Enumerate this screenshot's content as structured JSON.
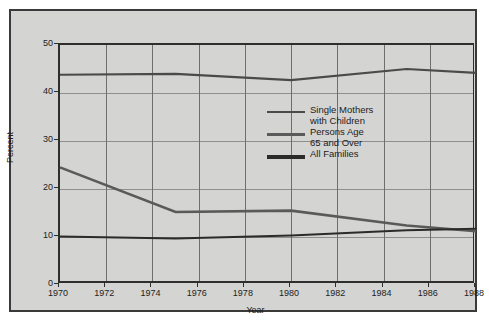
{
  "chart_data": {
    "type": "line",
    "title": "",
    "xlabel": "Year",
    "ylabel": "Percent",
    "xlim": [
      1970,
      1988
    ],
    "ylim": [
      0,
      50
    ],
    "xticks": [
      1970,
      1972,
      1974,
      1976,
      1978,
      1980,
      1982,
      1984,
      1986,
      1988
    ],
    "yticks": [
      0,
      10,
      20,
      30,
      40,
      50
    ],
    "grid": true,
    "legend_position": "center",
    "x": [
      1970,
      1975,
      1980,
      1985,
      1988
    ],
    "series": [
      {
        "name": "Single Mothers with Children",
        "color": "#4a4a4a",
        "width": 2.2,
        "values": [
          43.8,
          44.0,
          42.7,
          45.0,
          44.2
        ]
      },
      {
        "name": "Persons Age 65 and Over",
        "color": "#5a5a5a",
        "width": 2.6,
        "values": [
          24.5,
          15.2,
          15.5,
          12.4,
          11.2
        ]
      },
      {
        "name": "All Families",
        "color": "#2b2b2b",
        "width": 2.0,
        "values": [
          10.1,
          9.7,
          10.3,
          11.4,
          11.7
        ]
      }
    ]
  },
  "axes": {
    "y_label": "Percent",
    "x_label": "Year",
    "y_tick_labels": [
      "0",
      "10",
      "20",
      "30",
      "40",
      "50"
    ],
    "x_tick_labels": [
      "1970",
      "1972",
      "1974",
      "1976",
      "1978",
      "1980",
      "1982",
      "1984",
      "1986",
      "1988"
    ]
  },
  "legend": {
    "items": [
      {
        "label": "Single Mothers\nwith Children",
        "color": "#4a4a4a",
        "thickness": "2px"
      },
      {
        "label": "Persons Age\n65 and Over",
        "color": "#5a5a5a",
        "thickness": "3px"
      },
      {
        "label": "All Families",
        "color": "#2b2b2b",
        "thickness": "4px"
      }
    ]
  },
  "colors": {
    "panel_background": "#d4d4d2",
    "page_background": "#ffffff",
    "border": "#3a3a3a",
    "gridline": "#8f8f8d",
    "text": "#1c1c1c"
  }
}
